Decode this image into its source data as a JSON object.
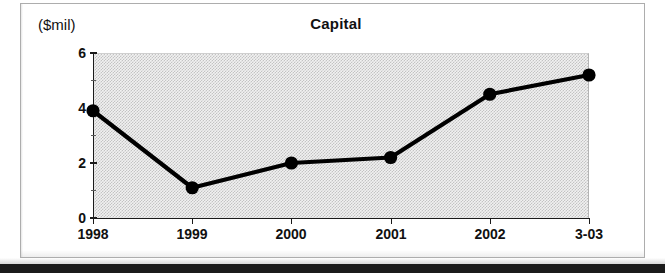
{
  "figure": {
    "title": "Capital",
    "y_unit_label": "($mil)"
  },
  "chart_data": {
    "type": "line",
    "title": "Capital",
    "xlabel": "",
    "ylabel": "($mil)",
    "units": "$mil",
    "categories": [
      "1998",
      "1999",
      "2000",
      "2001",
      "2002",
      "3-03"
    ],
    "values": [
      3.9,
      1.1,
      2.0,
      2.2,
      4.5,
      5.2
    ],
    "series": [
      {
        "name": "Capital",
        "values": [
          3.9,
          1.1,
          2.0,
          2.2,
          4.5,
          5.2
        ],
        "color": "#000000",
        "marker": "filled-circle"
      }
    ],
    "ylim": [
      0,
      6
    ],
    "y_major_ticks": [
      0,
      2,
      4,
      6
    ],
    "y_major_tick_labels": [
      "0",
      "2",
      "4",
      "6"
    ],
    "y_minor_ticks": [
      1,
      3,
      5
    ],
    "grid": false,
    "legend": "none",
    "plot_background": "#f1f1f1",
    "line_color": "#000000",
    "text_color": "#111111"
  }
}
